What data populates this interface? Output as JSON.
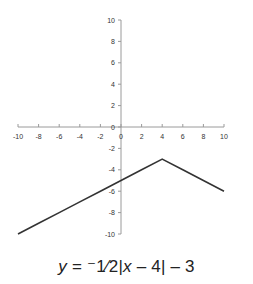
{
  "chart_data": {
    "type": "line",
    "title": "",
    "xlabel": "",
    "ylabel": "",
    "xlim": [
      -10,
      10
    ],
    "ylim": [
      -10,
      10
    ],
    "grid": false,
    "legend": null,
    "x_ticks": [
      -10,
      -8,
      -6,
      -4,
      -2,
      0,
      2,
      4,
      6,
      8,
      10
    ],
    "y_ticks": [
      10,
      8,
      6,
      4,
      2,
      0,
      -2,
      -4,
      -6,
      -8,
      -10
    ],
    "series": [
      {
        "name": "y = -1/2|x-4| - 3",
        "x": [
          -10,
          -8,
          -6,
          -4,
          -2,
          0,
          2,
          4,
          6,
          8,
          10
        ],
        "y": [
          -10,
          -9,
          -8,
          -7,
          -6,
          -5,
          -4,
          -3,
          -4,
          -5,
          -6
        ],
        "color": "#333333"
      }
    ],
    "annotations": [
      {
        "text": "y = ⁻1⁄2|x – 4| – 3",
        "position": "below-chart"
      }
    ]
  },
  "equation": {
    "lhs": "y",
    "equals": " = ",
    "rhs": "⁻1⁄2|",
    "var_x": "x",
    "rest": " – 4| – 3"
  }
}
